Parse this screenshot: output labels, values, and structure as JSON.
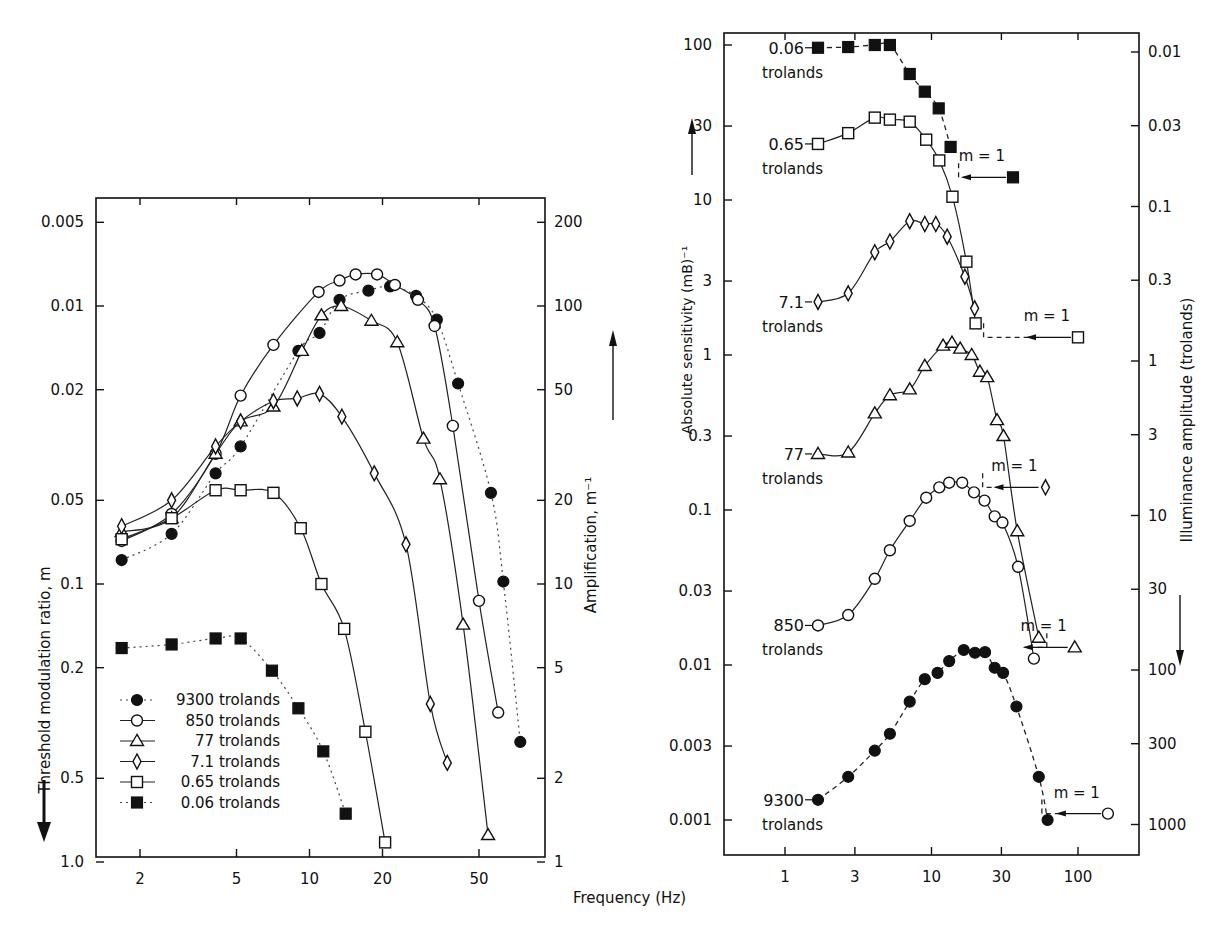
{
  "figure": {
    "shared_xlabel": "Frequency (Hz)"
  },
  "chart_data": [
    {
      "type": "line",
      "id": "left",
      "title": "",
      "xlabel": "Frequency (Hz)",
      "ylabel": "Threshold modulation ratio, m",
      "ylabel_right": "Amplification, m⁻¹",
      "xscale": "log",
      "yscale": "log",
      "y_inverted": true,
      "xlim": [
        1.32,
        94
      ],
      "ylim": [
        0.0042,
        1.0
      ],
      "x_ticks": [
        2,
        5,
        10,
        20,
        50
      ],
      "x_tick_labels": [
        "2",
        "5",
        "10",
        "20",
        "50"
      ],
      "y_ticks": [
        0.005,
        0.01,
        0.02,
        0.05,
        0.1,
        0.2,
        0.5,
        1.0
      ],
      "y_tick_labels": [
        "0.005",
        "0.01",
        "0.02",
        "0.05",
        "0.1",
        "0.2",
        "0.5",
        "1.0"
      ],
      "y_right_ticks": [
        200,
        100,
        50,
        20,
        10,
        5,
        2,
        1
      ],
      "y_right_tick_labels": [
        "200",
        "100",
        "50",
        "20",
        "10",
        "5",
        "2",
        "1"
      ],
      "grid": false,
      "legend_position": "lower-left",
      "legend": [
        {
          "label": "9300 trolands",
          "marker": "circle-filled",
          "line": "dotted"
        },
        {
          "label": "850 trolands",
          "marker": "circle-open",
          "line": "solid"
        },
        {
          "label": "77 trolands",
          "marker": "triangle-open",
          "line": "solid"
        },
        {
          "label": "7.1 trolands",
          "marker": "diamond-open",
          "line": "solid"
        },
        {
          "label": "0.65 trolands",
          "marker": "square-open",
          "line": "solid"
        },
        {
          "label": "0.06 trolands",
          "marker": "square-filled",
          "line": "dotted"
        }
      ],
      "series": [
        {
          "name": "9300 trolands",
          "marker": "circle-filled",
          "line": "dotted",
          "x": [
            1.68,
            2.7,
            4.1,
            5.2,
            9.0,
            11.0,
            13.3,
            17.5,
            21.5,
            27.5,
            33.5,
            41.0,
            56.0,
            63.0,
            74.0
          ],
          "y": [
            0.082,
            0.066,
            0.04,
            0.032,
            0.0145,
            0.0125,
            0.0095,
            0.0088,
            0.0085,
            0.0092,
            0.0112,
            0.019,
            0.047,
            0.098,
            0.37
          ]
        },
        {
          "name": "850 trolands",
          "marker": "circle-open",
          "line": "solid",
          "x": [
            1.68,
            2.7,
            4.1,
            5.2,
            7.1,
            10.9,
            13.3,
            15.5,
            19.0,
            22.5,
            28.0,
            32.8,
            39.0,
            50.0,
            60.0
          ],
          "y": [
            0.07,
            0.056,
            0.034,
            0.021,
            0.0138,
            0.0089,
            0.0081,
            0.0077,
            0.0077,
            0.0084,
            0.0095,
            0.0118,
            0.027,
            0.115,
            0.29
          ]
        },
        {
          "name": "77 trolands",
          "marker": "triangle-open",
          "line": "solid",
          "x": [
            1.68,
            2.7,
            4.1,
            5.2,
            7.1,
            9.3,
            11.2,
            13.5,
            18.0,
            23.0,
            29.5,
            34.5,
            43.0,
            54.5
          ],
          "y": [
            0.065,
            0.058,
            0.034,
            0.026,
            0.023,
            0.0145,
            0.0108,
            0.01,
            0.0113,
            0.0135,
            0.03,
            0.042,
            0.14,
            0.8
          ]
        },
        {
          "name": "7.1 trolands",
          "marker": "diamond-open",
          "line": "solid",
          "x": [
            1.68,
            2.7,
            4.1,
            5.2,
            7.1,
            8.9,
            11.0,
            13.6,
            18.5,
            25.0,
            31.5,
            37.0
          ],
          "y": [
            0.062,
            0.05,
            0.032,
            0.026,
            0.022,
            0.0215,
            0.0207,
            0.025,
            0.04,
            0.072,
            0.27,
            0.44
          ]
        },
        {
          "name": "0.65 trolands",
          "marker": "square-open",
          "line": "solid",
          "x": [
            1.68,
            2.7,
            4.1,
            5.2,
            7.1,
            9.2,
            11.2,
            13.9,
            17.0,
            20.5
          ],
          "y": [
            0.069,
            0.058,
            0.046,
            0.046,
            0.047,
            0.063,
            0.1,
            0.145,
            0.34,
            0.85
          ]
        },
        {
          "name": "0.06 trolands",
          "marker": "square-filled",
          "line": "dotted",
          "x": [
            1.68,
            2.7,
            4.1,
            5.2,
            7.0,
            9.0,
            11.4,
            14.1
          ],
          "y": [
            0.17,
            0.165,
            0.157,
            0.157,
            0.205,
            0.28,
            0.4,
            0.67
          ]
        }
      ]
    },
    {
      "type": "line",
      "id": "right",
      "title": "",
      "xlabel": "Frequency (Hz)",
      "ylabel": "Absolute sensitivity (mB)⁻¹",
      "ylabel_right": "Illuminance amplitude (trolands)",
      "xscale": "log",
      "yscale": "log",
      "xlim": [
        0.39,
        93000
      ],
      "ylim": [
        0.0005,
        125
      ],
      "x_ticks": [
        1,
        3,
        10,
        30,
        100
      ],
      "x_tick_labels": [
        "1",
        "3",
        "10",
        "30",
        "100"
      ],
      "y_ticks": [
        100,
        30,
        10,
        3,
        1,
        0.3,
        0.1,
        0.03,
        0.01,
        0.003,
        0.001
      ],
      "y_tick_labels": [
        "100",
        "30",
        "10",
        "3",
        "1",
        "0.3",
        "0.1",
        "0.03",
        "0.01",
        "0.003",
        "0.001"
      ],
      "y_right_ticks": [
        0.01,
        0.03,
        0.1,
        0.3,
        1,
        3,
        10,
        30,
        100,
        300,
        1000
      ],
      "y_right_tick_labels": [
        "0.01",
        "0.03",
        "0.1",
        "0.3",
        "1",
        "3",
        "10",
        "30",
        "100",
        "300",
        "1000"
      ],
      "grid": false,
      "annotations": [
        "0.06 trolands",
        "0.65 trolands",
        "7.1 trolands",
        "77 trolands",
        "850 trolands",
        "9300 trolands",
        "m = 1",
        "m = 1",
        "m = 1",
        "m = 1",
        "m = 1"
      ],
      "series": [
        {
          "name": "0.06 trolands",
          "marker": "square-filled",
          "line": "dashed",
          "x": [
            1.68,
            2.7,
            4.1,
            5.2,
            7.1,
            9.0,
            11.2,
            13.5
          ],
          "y": [
            96,
            97,
            100,
            100,
            65,
            50,
            39,
            22
          ],
          "m1": {
            "x": 36,
            "y": 14
          }
        },
        {
          "name": "0.65 trolands",
          "marker": "square-open",
          "line": "solid",
          "x": [
            1.68,
            2.7,
            4.1,
            5.2,
            7.1,
            9.2,
            11.3,
            13.9,
            17.3,
            20.0
          ],
          "y": [
            23,
            27,
            34,
            33,
            32,
            24.5,
            18,
            10.5,
            4.0,
            1.6
          ],
          "m1": {
            "x": 100,
            "y": 1.3
          }
        },
        {
          "name": "7.1 trolands",
          "marker": "diamond-open",
          "line": "solid",
          "x": [
            1.68,
            2.7,
            4.1,
            5.2,
            7.1,
            9.0,
            10.7,
            12.8,
            16.9,
            19.7
          ],
          "y": [
            2.2,
            2.5,
            4.6,
            5.4,
            7.3,
            7.0,
            7.0,
            5.8,
            3.2,
            2.0
          ],
          "m1": {
            "x": 60,
            "y": 0.14
          }
        },
        {
          "name": "77 trolands",
          "marker": "triangle-open",
          "line": "solid",
          "x": [
            1.68,
            2.7,
            4.1,
            5.2,
            7.1,
            9.0,
            12.0,
            13.8,
            15.7,
            18.8,
            21.4,
            24.0,
            28.0,
            31.0,
            38.5,
            54.0
          ],
          "y": [
            0.23,
            0.235,
            0.42,
            0.55,
            0.6,
            0.85,
            1.15,
            1.2,
            1.1,
            1.0,
            0.78,
            0.72,
            0.38,
            0.3,
            0.073,
            0.015
          ],
          "m1": {
            "x": 95,
            "y": 0.013
          }
        },
        {
          "name": "850 trolands",
          "marker": "circle-open",
          "line": "solid",
          "x": [
            1.68,
            2.7,
            4.1,
            5.2,
            7.1,
            9.2,
            11.3,
            13.2,
            16.2,
            19.5,
            23.0,
            27.0,
            30.5,
            39.0,
            50.0
          ],
          "y": [
            0.018,
            0.021,
            0.036,
            0.055,
            0.085,
            0.12,
            0.14,
            0.15,
            0.15,
            0.13,
            0.115,
            0.091,
            0.083,
            0.043,
            0.011
          ],
          "m1": {
            "x": 160,
            "y": 0.0011
          }
        },
        {
          "name": "9300 trolands",
          "marker": "circle-filled",
          "line": "dashed",
          "x": [
            1.68,
            2.7,
            4.1,
            5.2,
            7.1,
            9.0,
            11.0,
            13.2,
            16.6,
            19.8,
            23.2,
            27.0,
            30.8,
            38.0,
            54.0,
            62.0
          ],
          "y": [
            0.00135,
            0.0019,
            0.0028,
            0.0036,
            0.0058,
            0.0081,
            0.0089,
            0.0106,
            0.0125,
            0.012,
            0.0121,
            0.0096,
            0.0089,
            0.0054,
            0.0019,
            0.001
          ]
        }
      ]
    }
  ]
}
